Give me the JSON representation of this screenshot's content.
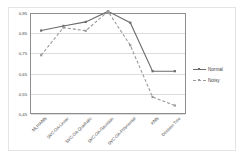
{
  "chart_data": {
    "type": "line",
    "title": "",
    "xlabel": "",
    "ylabel": "",
    "ylim": [
      0.45,
      0.95
    ],
    "yticks": [
      0.95,
      0.85,
      0.75,
      0.65,
      0.55,
      0.45
    ],
    "ytick_labels": [
      "0,95",
      "0,85",
      "0,75",
      "0,65",
      "0,55",
      "0,45"
    ],
    "grid": true,
    "legend_position": "right",
    "categories": [
      "MLP/ANN",
      "SVC-OA-Linear",
      "SVC-OA-Quadratic",
      "SVC-OA-Gaussian",
      "SVC-OA-Polynomial",
      "KNN",
      "Decision Tree"
    ],
    "series": [
      {
        "name": "Normal",
        "style": "solid",
        "color": "#6b6b6b",
        "values": [
          0.863,
          0.886,
          0.906,
          0.958,
          0.902,
          0.662,
          0.662
        ]
      },
      {
        "name": "Noisy",
        "style": "dashed",
        "color": "#9a9a9a",
        "values": [
          0.741,
          0.878,
          0.862,
          0.958,
          0.79,
          0.534,
          0.492
        ]
      }
    ]
  },
  "legend": {
    "items": [
      {
        "label": "Normal"
      },
      {
        "label": "Noisy"
      }
    ]
  }
}
